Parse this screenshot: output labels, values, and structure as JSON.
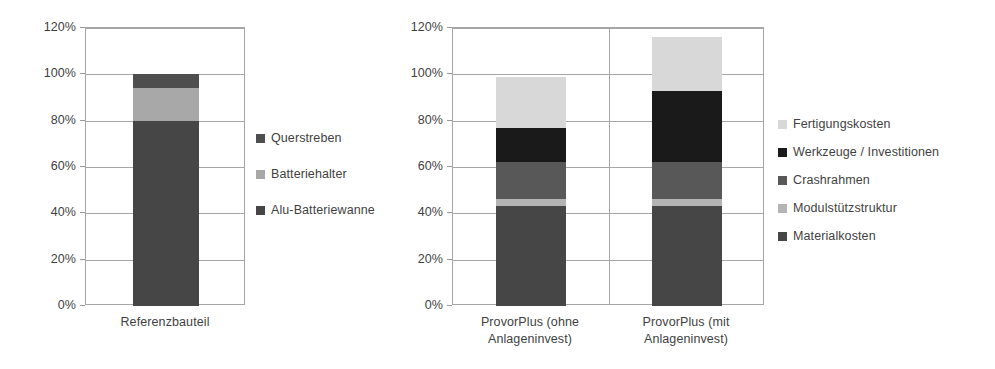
{
  "chart_data": [
    {
      "id": "left",
      "type": "bar",
      "subtype": "stacked-bar",
      "title": "",
      "xlabel": "",
      "ylabel": "",
      "categories": [
        "Referenzbauteil"
      ],
      "ylim": [
        0,
        120
      ],
      "ytick_labels": [
        "0%",
        "20%",
        "40%",
        "60%",
        "80%",
        "100%",
        "120%"
      ],
      "ytick_values": [
        0,
        20,
        40,
        60,
        80,
        100,
        120
      ],
      "grid": true,
      "legend_position": "right",
      "series": [
        {
          "name": "Alu-Batteriewanne",
          "values": [
            80
          ],
          "color": "#464646"
        },
        {
          "name": "Batteriehalter",
          "values": [
            14
          ],
          "color": "#a8a8a8"
        },
        {
          "name": "Querstreben",
          "values": [
            6
          ],
          "color": "#4e4e4e"
        }
      ],
      "legend_order": [
        "Querstreben",
        "Batteriehalter",
        "Alu-Batteriewanne"
      ],
      "totals": [
        100
      ]
    },
    {
      "id": "right",
      "type": "bar",
      "subtype": "stacked-bar",
      "title": "",
      "xlabel": "",
      "ylabel": "",
      "categories": [
        "ProvorPlus (ohne\nAnlageninvest)",
        "ProvorPlus (mit\nAnlageninvest)"
      ],
      "ylim": [
        0,
        120
      ],
      "ytick_labels": [
        "0%",
        "20%",
        "40%",
        "60%",
        "80%",
        "100%",
        "120%"
      ],
      "ytick_values": [
        0,
        20,
        40,
        60,
        80,
        100,
        120
      ],
      "grid": true,
      "legend_position": "right",
      "series": [
        {
          "name": "Materialkosten",
          "values": [
            43,
            43
          ],
          "color": "#464646"
        },
        {
          "name": "Modulstützstruktur",
          "values": [
            3,
            3
          ],
          "color": "#b4b4b4"
        },
        {
          "name": "Crashrahmen",
          "values": [
            16,
            16
          ],
          "color": "#585858"
        },
        {
          "name": "Werkzeuge / Investitionen",
          "values": [
            15,
            31
          ],
          "color": "#1a1a1a"
        },
        {
          "name": "Fertigungskosten",
          "values": [
            22,
            23
          ],
          "color": "#d8d8d8"
        }
      ],
      "legend_order": [
        "Fertigungskosten",
        "Werkzeuge / Investitionen",
        "Crashrahmen",
        "Modulstützstruktur",
        "Materialkosten"
      ],
      "totals": [
        99,
        116
      ]
    }
  ],
  "left_chart": {
    "y_ticks": [
      {
        "label": "120%"
      },
      {
        "label": "100%"
      },
      {
        "label": "80%"
      },
      {
        "label": "60%"
      },
      {
        "label": "40%"
      },
      {
        "label": "20%"
      },
      {
        "label": "0%"
      }
    ],
    "x_labels": [
      {
        "label": "Referenzbauteil"
      }
    ],
    "legend": [
      {
        "label": "Querstreben",
        "color": "#4e4e4e"
      },
      {
        "label": "Batteriehalter",
        "color": "#a8a8a8"
      },
      {
        "label": "Alu-Batteriewanne",
        "color": "#464646"
      }
    ]
  },
  "right_chart": {
    "y_ticks": [
      {
        "label": "120%"
      },
      {
        "label": "100%"
      },
      {
        "label": "80%"
      },
      {
        "label": "60%"
      },
      {
        "label": "40%"
      },
      {
        "label": "20%"
      },
      {
        "label": "0%"
      }
    ],
    "x_labels": [
      {
        "label": "ProvorPlus (ohne\nAnlageninvest)"
      },
      {
        "label": "ProvorPlus (mit\nAnlageninvest)"
      }
    ],
    "legend": [
      {
        "label": "Fertigungskosten",
        "color": "#d8d8d8"
      },
      {
        "label": "Werkzeuge / Investitionen",
        "color": "#1a1a1a"
      },
      {
        "label": "Crashrahmen",
        "color": "#585858"
      },
      {
        "label": "Modulstützstruktur",
        "color": "#b4b4b4"
      },
      {
        "label": "Materialkosten",
        "color": "#464646"
      }
    ]
  }
}
